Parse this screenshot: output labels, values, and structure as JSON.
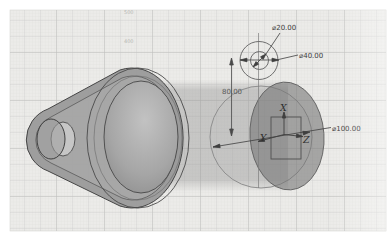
{
  "view": {
    "type": "cad-isometric-sketch-view"
  },
  "dimensions": {
    "inner_circle_diameter": "⌀20.00",
    "outer_circle_diameter": "⌀40.00",
    "large_circle_diameter": "⌀100.00",
    "center_offset": "80.00"
  },
  "axes": {
    "x": "X",
    "y": "Y",
    "z": "Z"
  },
  "grid_labels": {
    "top": "500",
    "mid": "400"
  },
  "colors": {
    "paper": "#ecebe9",
    "grid_minor": "#dfdfdd",
    "grid_major": "#c9c9c7",
    "part_fill": "#989898",
    "preview_cylinder": "#949494",
    "sketch_line": "#6e6e6e",
    "dimension_text": "#3c3c3c"
  }
}
